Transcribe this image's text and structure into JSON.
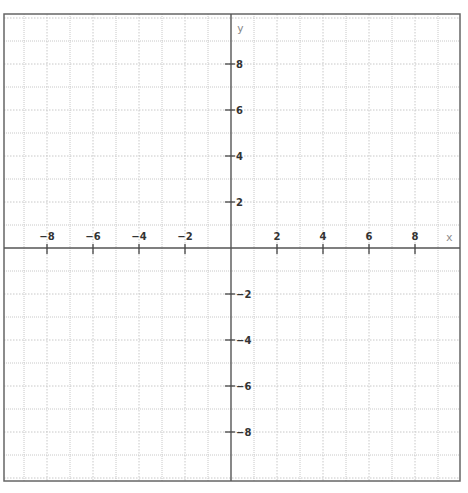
{
  "chart_data": {
    "type": "line",
    "title": "",
    "xlabel": "x",
    "ylabel": "y",
    "xlim": [
      -9.9,
      10
    ],
    "ylim": [
      -10.1,
      10.2
    ],
    "grid": true,
    "grid_step": 1,
    "x_ticks": [
      -8,
      -6,
      -4,
      -2,
      2,
      4,
      6,
      8
    ],
    "y_ticks": [
      8,
      6,
      4,
      2,
      -2,
      -4,
      -6,
      -8
    ],
    "x_tick_labels": [
      "−8",
      "−6",
      "−4",
      "−2",
      "2",
      "4",
      "6",
      "8"
    ],
    "y_tick_labels": [
      "8",
      "6",
      "4",
      "2",
      "−2",
      "−4",
      "−6",
      "−8"
    ],
    "series": []
  },
  "colors": {
    "axis": "#555555",
    "border": "#666666",
    "grid": "#c8c8c8",
    "label": "#333333"
  }
}
